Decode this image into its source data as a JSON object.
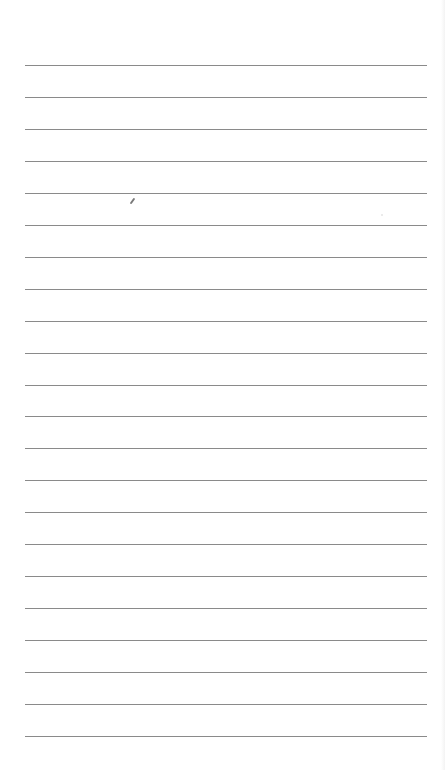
{
  "notepad": {
    "line_count": 22,
    "first_line_y": 65,
    "line_spacing": 31.95,
    "line_left": 25,
    "line_right": 427,
    "line_color": "#8a8a8a",
    "background": "#ffffff"
  },
  "marks": [
    {
      "icon": "pencil-mark-icon",
      "x": 132,
      "y": 204
    }
  ]
}
